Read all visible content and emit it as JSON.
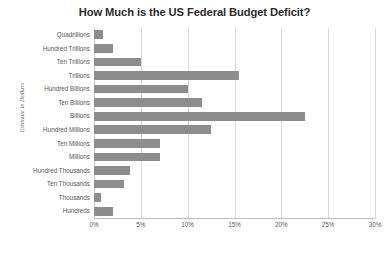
{
  "chart_data": {
    "type": "bar",
    "orientation": "horizontal",
    "title": "How Much is the US Federal Budget Deficit?",
    "xlabel": "",
    "ylabel": "Estimate in Dollars",
    "categories": [
      "Quadrillions",
      "Hundred Trillions",
      "Ten Trillions",
      "Trillions",
      "Hundred Billions",
      "Ten Billions",
      "Billions",
      "Hundred Millions",
      "Ten Millions",
      "Millions",
      "Hundred Thousands",
      "Ten Thousands",
      "Thousands",
      "Hundreds"
    ],
    "values": [
      1.0,
      2.0,
      5.0,
      15.5,
      10.0,
      11.5,
      22.5,
      12.5,
      7.0,
      7.0,
      3.8,
      3.2,
      0.7,
      2.0
    ],
    "value_unit": "%",
    "xlim": [
      0,
      30
    ],
    "xticks": [
      0,
      5,
      10,
      15,
      20,
      25,
      30
    ],
    "xtick_labels": [
      "0%",
      "5%",
      "10%",
      "15%",
      "20%",
      "25%",
      "30%"
    ],
    "grid": true,
    "grid_axis": "x",
    "legend": false,
    "bar_color": "#8d8d8d",
    "grid_color": "#d8d8d8",
    "title_color": "#2b2b2b",
    "label_color": "#585858"
  }
}
